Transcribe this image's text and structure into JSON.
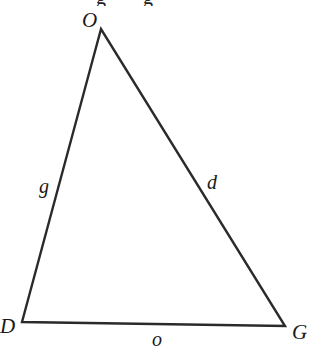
{
  "figure": {
    "type": "triangle",
    "stroke_color": "#2a2a2a",
    "label_color": "#1a1a1a",
    "background": "#ffffff",
    "vertices": [
      {
        "name": "O",
        "x": 101,
        "y": 29
      },
      {
        "name": "D",
        "x": 22,
        "y": 322
      },
      {
        "name": "G",
        "x": 285,
        "y": 326
      }
    ],
    "vertex_labels": {
      "O": "O",
      "D": "D",
      "G": "G"
    },
    "side_labels": {
      "OD": "g",
      "OG": "d",
      "DG": "o"
    }
  },
  "top_crop": {
    "note_visible": "",
    "glyph_fragments": [
      "g",
      "g"
    ]
  }
}
